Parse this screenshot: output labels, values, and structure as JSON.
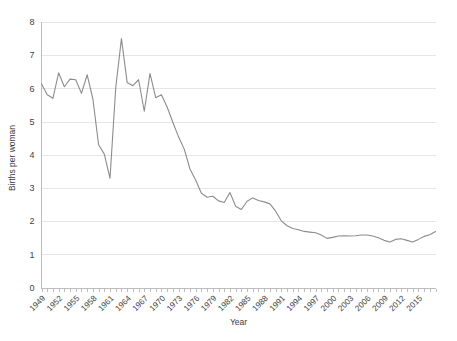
{
  "chart_data": {
    "type": "line",
    "title": "",
    "xlabel": "Year",
    "ylabel": "Births per woman",
    "xlim": [
      1949,
      2018
    ],
    "ylim": [
      0,
      8
    ],
    "yticks": [
      0,
      1,
      2,
      3,
      4,
      5,
      6,
      7,
      8
    ],
    "xticks": [
      1949,
      1952,
      1955,
      1958,
      1961,
      1964,
      1967,
      1970,
      1973,
      1976,
      1979,
      1982,
      1985,
      1988,
      1991,
      1994,
      1997,
      2000,
      2003,
      2006,
      2009,
      2012,
      2015
    ],
    "grid": true,
    "legend": "none",
    "line_color": "#8c8c8c",
    "x": [
      1949,
      1950,
      1951,
      1952,
      1953,
      1954,
      1955,
      1956,
      1957,
      1958,
      1959,
      1960,
      1961,
      1962,
      1963,
      1964,
      1965,
      1966,
      1967,
      1968,
      1969,
      1970,
      1971,
      1972,
      1973,
      1974,
      1975,
      1976,
      1977,
      1978,
      1979,
      1980,
      1981,
      1982,
      1983,
      1984,
      1985,
      1986,
      1987,
      1988,
      1989,
      1990,
      1991,
      1992,
      1993,
      1994,
      1995,
      1996,
      1997,
      1998,
      1999,
      2000,
      2001,
      2002,
      2003,
      2004,
      2005,
      2006,
      2007,
      2008,
      2009,
      2010,
      2011,
      2012,
      2013,
      2014,
      2015,
      2016,
      2017,
      2018
    ],
    "y": [
      6.14,
      5.81,
      5.7,
      6.47,
      6.05,
      6.28,
      6.26,
      5.85,
      6.41,
      5.68,
      4.3,
      4.02,
      3.29,
      6.02,
      7.5,
      6.18,
      6.08,
      6.26,
      5.31,
      6.45,
      5.72,
      5.81,
      5.44,
      4.98,
      4.54,
      4.17,
      3.57,
      3.24,
      2.84,
      2.72,
      2.75,
      2.61,
      2.56,
      2.86,
      2.45,
      2.35,
      2.6,
      2.7,
      2.62,
      2.58,
      2.52,
      2.3,
      2.01,
      1.86,
      1.78,
      1.74,
      1.69,
      1.67,
      1.65,
      1.58,
      1.48,
      1.51,
      1.55,
      1.56,
      1.55,
      1.56,
      1.58,
      1.58,
      1.55,
      1.5,
      1.42,
      1.37,
      1.45,
      1.47,
      1.42,
      1.37,
      1.45,
      1.54,
      1.59,
      1.69
    ]
  }
}
